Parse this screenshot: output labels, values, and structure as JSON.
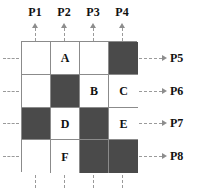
{
  "figure": {
    "colors": {
      "filled_cell": "#4a4a4a",
      "empty_cell": "#ffffff",
      "grid_line": "#8b8b8b",
      "guide_line": "#9a9a9a",
      "text": "#111111"
    },
    "column_labels": [
      "P1",
      "P2",
      "P3",
      "P4"
    ],
    "row_labels": [
      "P5",
      "P6",
      "P7",
      "P8"
    ],
    "grid": {
      "rows": 4,
      "cols": 4,
      "cells": [
        [
          {
            "fill": "white",
            "label": ""
          },
          {
            "fill": "white",
            "label": "A"
          },
          {
            "fill": "white",
            "label": ""
          },
          {
            "fill": "dark",
            "label": ""
          }
        ],
        [
          {
            "fill": "white",
            "label": ""
          },
          {
            "fill": "dark",
            "label": ""
          },
          {
            "fill": "white",
            "label": "B"
          },
          {
            "fill": "white",
            "label": "C"
          }
        ],
        [
          {
            "fill": "dark",
            "label": ""
          },
          {
            "fill": "white",
            "label": "D"
          },
          {
            "fill": "dark",
            "label": ""
          },
          {
            "fill": "white",
            "label": "E"
          }
        ],
        [
          {
            "fill": "white",
            "label": ""
          },
          {
            "fill": "white",
            "label": "F"
          },
          {
            "fill": "dark",
            "label": ""
          },
          {
            "fill": "dark",
            "label": ""
          }
        ]
      ]
    }
  }
}
